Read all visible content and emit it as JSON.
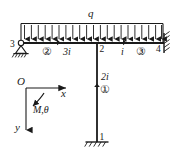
{
  "diagram": {
    "line_color": "#1a1a1a",
    "background": "#ffffff",
    "load": {
      "symbol": "q",
      "type": "uniformly-distributed-load",
      "direction": "downward",
      "arrow_count": 21
    },
    "nodes": [
      {
        "id": "node-1",
        "label": "1",
        "support": "fixed"
      },
      {
        "id": "node-2",
        "label": "2",
        "support": "rigid-joint"
      },
      {
        "id": "node-3",
        "label": "3",
        "support": "pinned"
      },
      {
        "id": "node-4",
        "label": "4",
        "support": "fixed"
      }
    ],
    "members": [
      {
        "id": "member-1",
        "circled_label": "①",
        "stiffness": "2i",
        "orientation": "vertical"
      },
      {
        "id": "member-2",
        "circled_label": "②",
        "stiffness": "3i",
        "orientation": "horizontal"
      },
      {
        "id": "member-3",
        "circled_label": "③",
        "stiffness": "i",
        "orientation": "horizontal"
      }
    ],
    "axes": {
      "origin_label": "O",
      "x_label": "x",
      "y_label": "y",
      "moment_label": "M,θ"
    }
  }
}
